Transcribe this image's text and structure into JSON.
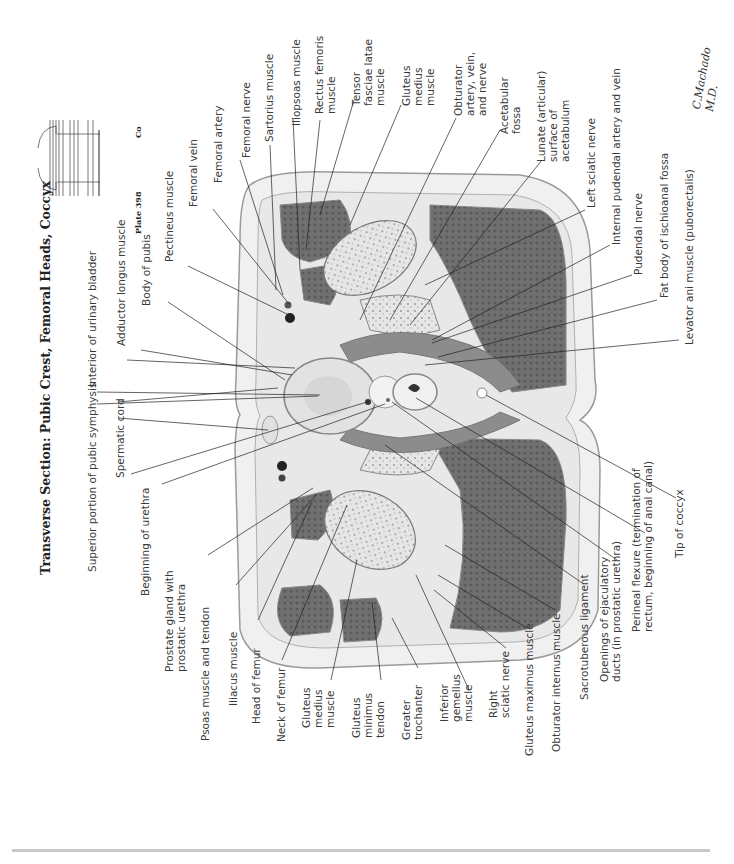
{
  "title": "Transverse Section: Pubic Crest, Femoral Heads, Coccyx",
  "plate": {
    "label": "Plate 398",
    "level_marker": "Co"
  },
  "signature": "C.Machado M.D.",
  "labels_left": [
    {
      "id": "superior-portion-pubic-symphysis",
      "text": "Superior portion of pubic symphysis"
    },
    {
      "id": "interior-urinary-bladder",
      "text": "Interior of urinary bladder"
    },
    {
      "id": "adductor-longus-muscle",
      "text": "Adductor longus muscle"
    },
    {
      "id": "body-of-pubis",
      "text": "Body of pubis"
    },
    {
      "id": "pectineus-muscle",
      "text": "Pectineus muscle"
    },
    {
      "id": "femoral-vein",
      "text": "Femoral vein"
    },
    {
      "id": "femoral-artery",
      "text": "Femoral artery"
    },
    {
      "id": "femoral-nerve",
      "text": "Femoral nerve"
    },
    {
      "id": "sartorius-muscle",
      "text": "Sartorius muscle"
    },
    {
      "id": "iliopsoas-muscle",
      "text": "Iliopsoas muscle"
    },
    {
      "id": "rectus-femoris-muscle",
      "text": "Rectus femoris\nmuscle"
    },
    {
      "id": "tensor-fasciae-latae-muscle",
      "text": "Tensor\nfasciae latae\nmuscle"
    },
    {
      "id": "gluteus-medius-muscle-top",
      "text": "Gluteus\nmedius\nmuscle"
    },
    {
      "id": "obturator-artery-vein-nerve",
      "text": "Obturator\nartery, vein,\nand nerve"
    },
    {
      "id": "acetabular-fossa",
      "text": "Acetabular\nfossa"
    },
    {
      "id": "lunate-surface-acetabulum",
      "text": "Lunate (articular)\nsurface of\nacetabulum"
    },
    {
      "id": "left-sciatic-nerve",
      "text": "Left sciatic nerve"
    },
    {
      "id": "internal-pudendal-artery-vein",
      "text": "Internal pudendal artery and vein"
    },
    {
      "id": "pudendal-nerve",
      "text": "Pudendal nerve"
    },
    {
      "id": "fat-body-ischioanal-fossa",
      "text": "Fat body of ischioanal fossa"
    },
    {
      "id": "levator-ani-muscle",
      "text": "Levator ani muscle (puborectalis)"
    }
  ],
  "labels_bottom": [
    {
      "id": "spermatic-cord",
      "text": "Spermatic cord"
    },
    {
      "id": "beginning-of-urethra",
      "text": "Beginning of urethra"
    },
    {
      "id": "prostate-gland",
      "text": "Prostate gland with\nprostatic urethra"
    },
    {
      "id": "psoas-muscle-tendon",
      "text": "Psoas muscle and tendon"
    },
    {
      "id": "iliacus-muscle",
      "text": "Iliacus muscle"
    },
    {
      "id": "head-of-femur",
      "text": "Head of femur"
    },
    {
      "id": "neck-of-femur",
      "text": "Neck of femur"
    },
    {
      "id": "gluteus-medius-muscle-bottom",
      "text": "Gluteus\nmedius\nmuscle"
    },
    {
      "id": "gluteus-minimus-tendon",
      "text": "Gluteus\nminimus\ntendon"
    },
    {
      "id": "greater-trochanter",
      "text": "Greater\ntrochanter"
    },
    {
      "id": "inferior-gemellus-muscle",
      "text": "Inferior\ngemellus\nmuscle"
    },
    {
      "id": "right-sciatic-nerve",
      "text": "Right\nsciatic nerve"
    },
    {
      "id": "gluteus-maximus-muscle",
      "text": "Gluteus maximus muscle"
    },
    {
      "id": "obturator-internus-muscle",
      "text": "Obturator internus muscle"
    },
    {
      "id": "sacrotuberous-ligament",
      "text": "Sacrotuberous ligament"
    },
    {
      "id": "openings-ejaculatory-ducts",
      "text": "Openings of ejaculatory\nducts (in prostatic urethra)"
    },
    {
      "id": "perineal-flexure",
      "text": "Perineal flexure (termination of\nrectum, beginning of anal canal)"
    },
    {
      "id": "tip-of-coccyx",
      "text": "Tip of coccyx"
    }
  ],
  "colors": {
    "muscle": "#6e6e6e",
    "bone": "#e4e4e4",
    "fat": "#f2f2f2",
    "outline": "#9a9a9a",
    "leader": "#222222",
    "rule": "#c8c8c8"
  }
}
